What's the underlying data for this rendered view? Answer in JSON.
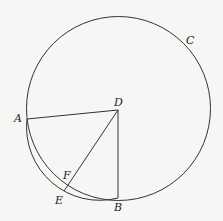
{
  "diagram": {
    "type": "geometry",
    "colors": {
      "background": "#f6f6f4",
      "stroke": "#333333",
      "label": "#222222"
    },
    "main_circle": {
      "cx": 118.5,
      "cy": 108.5,
      "r": 92,
      "label": "C"
    },
    "outer_arc": {
      "from": "A",
      "to": "B",
      "through": "E",
      "cx": 99.7,
      "cy": 127.1,
      "r": 73.2
    },
    "points": {
      "A": {
        "label": "A",
        "x": 27,
        "y": 119
      },
      "B": {
        "label": "B",
        "x": 118,
        "y": 198
      },
      "C": {
        "label": "C"
      },
      "D": {
        "label": "D",
        "x": 118,
        "y": 110
      },
      "E": {
        "label": "E",
        "x": 64,
        "y": 191
      },
      "F": {
        "label": "F",
        "x": 68,
        "y": 184
      }
    },
    "segments": [
      {
        "from": "D",
        "to": "A"
      },
      {
        "from": "D",
        "to": "B"
      },
      {
        "from": "D",
        "to": "E"
      }
    ],
    "labels": {
      "A": "A",
      "B": "B",
      "C": "C",
      "D": "D",
      "E": "E",
      "F": "F"
    }
  }
}
